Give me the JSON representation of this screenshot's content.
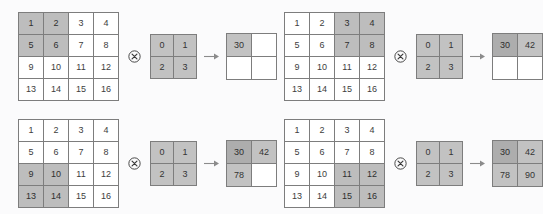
{
  "figure": {
    "operator_conv_symbol": "circled-times",
    "operator_arrow_symbol": "right-arrow",
    "colors": {
      "background": "#fbfbfc",
      "grid_line": "#7d7d7d",
      "cell_background": "#ffffff",
      "highlight_window": "#bdbdbd",
      "kernel_fill": "#c2c2c2",
      "output_new": "#c2c2c2",
      "output_old": "#adadad",
      "text": "#3d3d3d"
    }
  },
  "chart_data": {
    "type": "diagram",
    "input_matrix": [
      [
        1,
        2,
        3,
        4
      ],
      [
        5,
        6,
        7,
        8
      ],
      [
        9,
        10,
        11,
        12
      ],
      [
        13,
        14,
        15,
        16
      ]
    ],
    "kernel_matrix": [
      [
        0,
        1
      ],
      [
        2,
        3
      ]
    ],
    "output_matrix": [
      [
        30,
        42
      ],
      [
        78,
        90
      ]
    ]
  },
  "panels": [
    {
      "id": "panel-0",
      "step": 1,
      "input": {
        "label": "input-matrix",
        "rows": [
          [
            {
              "value": "1",
              "state": "window"
            },
            {
              "value": "2",
              "state": "window"
            },
            {
              "value": "3",
              "state": "plain"
            },
            {
              "value": "4",
              "state": "plain"
            }
          ],
          [
            {
              "value": "5",
              "state": "window"
            },
            {
              "value": "6",
              "state": "window"
            },
            {
              "value": "7",
              "state": "plain"
            },
            {
              "value": "8",
              "state": "plain"
            }
          ],
          [
            {
              "value": "9",
              "state": "plain"
            },
            {
              "value": "10",
              "state": "plain"
            },
            {
              "value": "11",
              "state": "plain"
            },
            {
              "value": "12",
              "state": "plain"
            }
          ],
          [
            {
              "value": "13",
              "state": "plain"
            },
            {
              "value": "14",
              "state": "plain"
            },
            {
              "value": "15",
              "state": "plain"
            },
            {
              "value": "16",
              "state": "plain"
            }
          ]
        ]
      },
      "kernel": {
        "label": "kernel-matrix",
        "rows": [
          [
            {
              "value": "0",
              "state": "kernel"
            },
            {
              "value": "1",
              "state": "kernel"
            }
          ],
          [
            {
              "value": "2",
              "state": "kernel"
            },
            {
              "value": "3",
              "state": "kernel"
            }
          ]
        ]
      },
      "output": {
        "label": "output-matrix",
        "rows": [
          [
            {
              "value": "30",
              "state": "new"
            },
            {
              "value": "",
              "state": "empty"
            }
          ],
          [
            {
              "value": "",
              "state": "empty"
            },
            {
              "value": "",
              "state": "empty"
            }
          ]
        ]
      }
    },
    {
      "id": "panel-1",
      "step": 2,
      "input": {
        "label": "input-matrix",
        "rows": [
          [
            {
              "value": "1",
              "state": "plain"
            },
            {
              "value": "2",
              "state": "plain"
            },
            {
              "value": "3",
              "state": "window"
            },
            {
              "value": "4",
              "state": "window"
            }
          ],
          [
            {
              "value": "5",
              "state": "plain"
            },
            {
              "value": "6",
              "state": "plain"
            },
            {
              "value": "7",
              "state": "window"
            },
            {
              "value": "8",
              "state": "window"
            }
          ],
          [
            {
              "value": "9",
              "state": "plain"
            },
            {
              "value": "10",
              "state": "plain"
            },
            {
              "value": "11",
              "state": "plain"
            },
            {
              "value": "12",
              "state": "plain"
            }
          ],
          [
            {
              "value": "13",
              "state": "plain"
            },
            {
              "value": "14",
              "state": "plain"
            },
            {
              "value": "15",
              "state": "plain"
            },
            {
              "value": "16",
              "state": "plain"
            }
          ]
        ]
      },
      "kernel": {
        "label": "kernel-matrix",
        "rows": [
          [
            {
              "value": "0",
              "state": "kernel"
            },
            {
              "value": "1",
              "state": "kernel"
            }
          ],
          [
            {
              "value": "2",
              "state": "kernel"
            },
            {
              "value": "3",
              "state": "kernel"
            }
          ]
        ]
      },
      "output": {
        "label": "output-matrix",
        "rows": [
          [
            {
              "value": "30",
              "state": "old"
            },
            {
              "value": "42",
              "state": "new"
            }
          ],
          [
            {
              "value": "",
              "state": "empty"
            },
            {
              "value": "",
              "state": "empty"
            }
          ]
        ]
      }
    },
    {
      "id": "panel-2",
      "step": 3,
      "input": {
        "label": "input-matrix",
        "rows": [
          [
            {
              "value": "1",
              "state": "plain"
            },
            {
              "value": "2",
              "state": "plain"
            },
            {
              "value": "3",
              "state": "plain"
            },
            {
              "value": "4",
              "state": "plain"
            }
          ],
          [
            {
              "value": "5",
              "state": "plain"
            },
            {
              "value": "6",
              "state": "plain"
            },
            {
              "value": "7",
              "state": "plain"
            },
            {
              "value": "8",
              "state": "plain"
            }
          ],
          [
            {
              "value": "9",
              "state": "window"
            },
            {
              "value": "10",
              "state": "window"
            },
            {
              "value": "11",
              "state": "plain"
            },
            {
              "value": "12",
              "state": "plain"
            }
          ],
          [
            {
              "value": "13",
              "state": "window"
            },
            {
              "value": "14",
              "state": "window"
            },
            {
              "value": "15",
              "state": "plain"
            },
            {
              "value": "16",
              "state": "plain"
            }
          ]
        ]
      },
      "kernel": {
        "label": "kernel-matrix",
        "rows": [
          [
            {
              "value": "0",
              "state": "kernel"
            },
            {
              "value": "1",
              "state": "kernel"
            }
          ],
          [
            {
              "value": "2",
              "state": "kernel"
            },
            {
              "value": "3",
              "state": "kernel"
            }
          ]
        ]
      },
      "output": {
        "label": "output-matrix",
        "rows": [
          [
            {
              "value": "30",
              "state": "old"
            },
            {
              "value": "42",
              "state": "new"
            }
          ],
          [
            {
              "value": "78",
              "state": "new"
            },
            {
              "value": "",
              "state": "empty"
            }
          ]
        ]
      }
    },
    {
      "id": "panel-3",
      "step": 4,
      "input": {
        "label": "input-matrix",
        "rows": [
          [
            {
              "value": "1",
              "state": "plain"
            },
            {
              "value": "2",
              "state": "plain"
            },
            {
              "value": "3",
              "state": "plain"
            },
            {
              "value": "4",
              "state": "plain"
            }
          ],
          [
            {
              "value": "5",
              "state": "plain"
            },
            {
              "value": "6",
              "state": "plain"
            },
            {
              "value": "7",
              "state": "plain"
            },
            {
              "value": "8",
              "state": "plain"
            }
          ],
          [
            {
              "value": "9",
              "state": "plain"
            },
            {
              "value": "10",
              "state": "plain"
            },
            {
              "value": "11",
              "state": "window"
            },
            {
              "value": "12",
              "state": "window"
            }
          ],
          [
            {
              "value": "13",
              "state": "plain"
            },
            {
              "value": "14",
              "state": "plain"
            },
            {
              "value": "15",
              "state": "window"
            },
            {
              "value": "16",
              "state": "window"
            }
          ]
        ]
      },
      "kernel": {
        "label": "kernel-matrix",
        "rows": [
          [
            {
              "value": "0",
              "state": "kernel"
            },
            {
              "value": "1",
              "state": "kernel"
            }
          ],
          [
            {
              "value": "2",
              "state": "kernel"
            },
            {
              "value": "3",
              "state": "kernel"
            }
          ]
        ]
      },
      "output": {
        "label": "output-matrix",
        "rows": [
          [
            {
              "value": "30",
              "state": "old"
            },
            {
              "value": "42",
              "state": "new"
            }
          ],
          [
            {
              "value": "78",
              "state": "new"
            },
            {
              "value": "90",
              "state": "new"
            }
          ]
        ]
      }
    }
  ]
}
